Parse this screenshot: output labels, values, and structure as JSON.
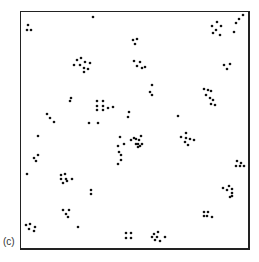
{
  "figure": {
    "panel_label": "(c)",
    "dot_color": "#111111",
    "border_color": "#222222",
    "dots": [
      [
        28,
        25
      ],
      [
        27,
        30
      ],
      [
        31,
        30
      ],
      [
        93,
        17
      ],
      [
        74,
        65
      ],
      [
        77,
        60
      ],
      [
        81,
        58
      ],
      [
        85,
        62
      ],
      [
        90,
        63
      ],
      [
        80,
        65
      ],
      [
        84,
        68
      ],
      [
        88,
        69
      ],
      [
        84,
        72
      ],
      [
        133,
        40
      ],
      [
        137,
        39
      ],
      [
        135,
        44
      ],
      [
        134,
        61
      ],
      [
        140,
        62
      ],
      [
        137,
        66
      ],
      [
        142,
        68
      ],
      [
        145,
        67
      ],
      [
        152,
        85
      ],
      [
        150,
        92
      ],
      [
        152,
        95
      ],
      [
        212,
        26
      ],
      [
        217,
        22
      ],
      [
        221,
        26
      ],
      [
        216,
        30
      ],
      [
        213,
        33
      ],
      [
        220,
        35
      ],
      [
        236,
        23
      ],
      [
        239,
        19
      ],
      [
        243,
        15
      ],
      [
        234,
        32
      ],
      [
        224,
        65
      ],
      [
        227,
        69
      ],
      [
        230,
        64
      ],
      [
        70,
        101
      ],
      [
        71,
        98
      ],
      [
        97,
        101
      ],
      [
        103,
        101
      ],
      [
        97,
        106
      ],
      [
        103,
        106
      ],
      [
        97,
        110
      ],
      [
        103,
        110
      ],
      [
        108,
        108
      ],
      [
        113,
        107
      ],
      [
        129,
        112
      ],
      [
        128,
        117
      ],
      [
        47,
        114
      ],
      [
        50,
        118
      ],
      [
        54,
        122
      ],
      [
        89,
        123
      ],
      [
        98,
        123
      ],
      [
        178,
        116
      ],
      [
        204,
        89
      ],
      [
        208,
        90
      ],
      [
        211,
        91
      ],
      [
        206,
        95
      ],
      [
        210,
        98
      ],
      [
        213,
        100
      ],
      [
        211,
        104
      ],
      [
        215,
        105
      ],
      [
        131,
        140
      ],
      [
        134,
        138
      ],
      [
        136,
        144
      ],
      [
        140,
        146
      ],
      [
        141,
        136
      ],
      [
        142,
        144
      ],
      [
        120,
        137
      ],
      [
        118,
        146
      ],
      [
        124,
        144
      ],
      [
        119,
        152
      ],
      [
        121,
        155
      ],
      [
        121,
        160
      ],
      [
        118,
        164
      ],
      [
        136,
        139
      ],
      [
        139,
        140
      ],
      [
        138,
        144
      ],
      [
        138,
        147
      ],
      [
        186,
        133
      ],
      [
        181,
        137
      ],
      [
        186,
        138
      ],
      [
        190,
        139
      ],
      [
        185,
        142
      ],
      [
        188,
        145
      ],
      [
        194,
        140
      ],
      [
        38,
        136
      ],
      [
        38,
        155
      ],
      [
        34,
        158
      ],
      [
        36,
        161
      ],
      [
        27,
        174
      ],
      [
        61,
        175
      ],
      [
        65,
        174
      ],
      [
        61,
        179
      ],
      [
        66,
        179
      ],
      [
        63,
        183
      ],
      [
        67,
        181
      ],
      [
        72,
        179
      ],
      [
        91,
        190
      ],
      [
        91,
        194
      ],
      [
        63,
        210
      ],
      [
        66,
        214
      ],
      [
        68,
        217
      ],
      [
        69,
        210
      ],
      [
        78,
        227
      ],
      [
        26,
        225
      ],
      [
        30,
        224
      ],
      [
        29,
        229
      ],
      [
        35,
        227
      ],
      [
        34,
        231
      ],
      [
        237,
        161
      ],
      [
        236,
        166
      ],
      [
        240,
        166
      ],
      [
        241,
        163
      ],
      [
        244,
        166
      ],
      [
        223,
        188
      ],
      [
        227,
        190
      ],
      [
        229,
        186
      ],
      [
        232,
        189
      ],
      [
        232,
        193
      ],
      [
        230,
        197
      ],
      [
        232,
        196
      ],
      [
        204,
        212
      ],
      [
        208,
        212
      ],
      [
        207,
        216
      ],
      [
        204,
        216
      ],
      [
        212,
        217
      ],
      [
        126,
        233
      ],
      [
        131,
        233
      ],
      [
        126,
        238
      ],
      [
        131,
        238
      ],
      [
        154,
        234
      ],
      [
        158,
        232
      ],
      [
        152,
        237
      ],
      [
        157,
        237
      ],
      [
        165,
        237
      ],
      [
        155,
        240
      ],
      [
        160,
        241
      ]
    ]
  }
}
